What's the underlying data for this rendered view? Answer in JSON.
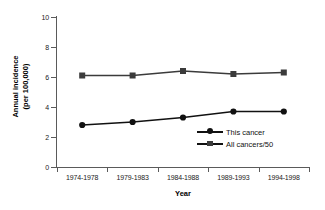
{
  "chart_data": {
    "type": "line",
    "title": "",
    "xlabel": "Year",
    "ylabel_line1": "Annual incidence",
    "ylabel_line2": "(per 100,000)",
    "categories": [
      "1974-1978",
      "1979-1983",
      "1984-1988",
      "1989-1993",
      "1994-1998"
    ],
    "ylim": [
      0,
      10
    ],
    "yticks": [
      0,
      2,
      4,
      6,
      8,
      10
    ],
    "ytick_labels": [
      "0",
      "2",
      "4",
      "6",
      "8",
      "10"
    ],
    "grid": false,
    "legend_position": "inside lower-right",
    "series": [
      {
        "name": "This cancer",
        "marker": "circle",
        "color": "#111111",
        "values": [
          2.8,
          3.0,
          3.3,
          3.7,
          3.7
        ]
      },
      {
        "name": "All cancers/50",
        "marker": "square",
        "color": "#3b3b3b",
        "values": [
          6.1,
          6.1,
          6.4,
          6.2,
          6.3
        ]
      }
    ]
  },
  "legend": {
    "items": [
      {
        "label": "This cancer",
        "marker": "circle-marker-icon"
      },
      {
        "label": "All cancers/50",
        "marker": "square-marker-icon"
      }
    ]
  },
  "axes": {
    "y_title_line1": "Annual incidence",
    "y_title_line2": "(per 100,000)",
    "x_title": "Year"
  },
  "colors": {
    "series_one": "#111111",
    "series_two": "#3b3b3b",
    "axis": "#5a5a5a",
    "background": "#ffffff",
    "text": "#1a1a1a"
  }
}
